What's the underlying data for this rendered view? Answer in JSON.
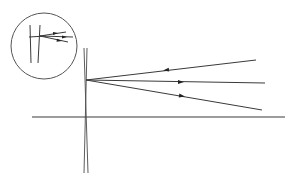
{
  "diagram": {
    "type": "ray-optics",
    "colors": {
      "line": "#3a3a3a",
      "arrow": "#222222",
      "background": "#ffffff"
    },
    "optical_axis": {
      "x1": 32,
      "y1": 117,
      "x2": 285,
      "y2": 117
    },
    "lens": {
      "left_edge": {
        "x1": 84,
        "y1": 48,
        "x2": 88,
        "y2": 173
      },
      "right_edge": {
        "x1": 87,
        "y1": 48,
        "x2": 84,
        "y2": 173
      }
    },
    "convergence_point": {
      "x": 86,
      "y": 80
    },
    "rays": [
      {
        "id": "upper",
        "end": {
          "x": 256,
          "y": 60
        },
        "arrow": {
          "x": 166,
          "y": 70,
          "direction": "left"
        }
      },
      {
        "id": "middle",
        "end": {
          "x": 265,
          "y": 83
        },
        "arrow": {
          "x": 181,
          "y": 82,
          "direction": "right"
        }
      },
      {
        "id": "lower",
        "end": {
          "x": 262,
          "y": 110
        },
        "arrow": {
          "x": 182,
          "y": 96,
          "direction": "right"
        }
      }
    ],
    "inset": {
      "circle": {
        "cx": 44,
        "cy": 46,
        "r": 33
      },
      "verticals": [
        {
          "x1": 30,
          "y1": 25,
          "x2": 31,
          "y2": 63
        },
        {
          "x1": 40,
          "y1": 25,
          "x2": 38,
          "y2": 63
        }
      ],
      "horizontal": {
        "x1": 29,
        "y1": 37,
        "x2": 46,
        "y2": 36
      },
      "rays": [
        {
          "end": {
            "x": 66,
            "y": 32
          }
        },
        {
          "end": {
            "x": 73,
            "y": 37
          }
        },
        {
          "end": {
            "x": 68,
            "y": 42
          }
        }
      ]
    }
  }
}
